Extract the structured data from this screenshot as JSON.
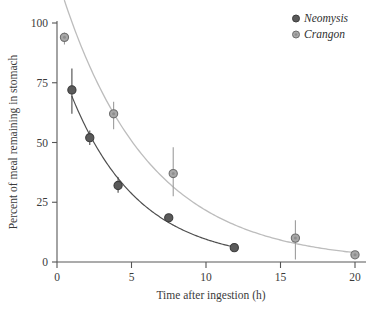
{
  "chart_data": {
    "type": "scatter",
    "title": "",
    "xlabel": "Time after ingestion (h)",
    "ylabel": "Percent of meal remaining in stomach",
    "xlim": [
      0,
      20.8
    ],
    "ylim": [
      0,
      100
    ],
    "xticks": [
      0,
      5,
      10,
      15,
      20
    ],
    "xtick_labels": [
      "0",
      "5",
      "10",
      "15",
      "20"
    ],
    "yticks": [
      0,
      25,
      50,
      75,
      100
    ],
    "ytick_labels": [
      "0",
      "25",
      "50",
      "75",
      "100"
    ],
    "grid": false,
    "legend_position": "top-right",
    "series": [
      {
        "name": "Neomysis",
        "marker": "filled-circle",
        "color": "#5a5a5a",
        "line_color": "#555555",
        "points": [
          {
            "x": 1.0,
            "y": 72.0,
            "err_low": 62.0,
            "err_high": 81.0
          },
          {
            "x": 2.2,
            "y": 52.0,
            "err_low": 49.0,
            "err_high": 55.0
          },
          {
            "x": 4.1,
            "y": 32.0,
            "err_low": 29.0,
            "err_high": 35.5
          },
          {
            "x": 7.5,
            "y": 18.5,
            "err_low": 18.5,
            "err_high": 18.5
          },
          {
            "x": 11.9,
            "y": 6.0,
            "err_low": 6.0,
            "err_high": 6.0
          }
        ],
        "fit_curve": "exponential decay"
      },
      {
        "name": "Crangon",
        "marker": "open-circle",
        "color": "#9d9d9d",
        "line_color": "#b4b4b4",
        "points": [
          {
            "x": 0.5,
            "y": 94.0,
            "err_low": 91.0,
            "err_high": 96.0
          },
          {
            "x": 3.8,
            "y": 62.0,
            "err_low": 55.5,
            "err_high": 67.0
          },
          {
            "x": 7.8,
            "y": 37.0,
            "err_low": 27.5,
            "err_high": 48.0
          },
          {
            "x": 16.0,
            "y": 10.0,
            "err_low": 1.0,
            "err_high": 17.5
          },
          {
            "x": 20.0,
            "y": 3.0,
            "err_low": 3.0,
            "err_high": 3.0
          }
        ],
        "fit_curve": "exponential decay"
      }
    ]
  },
  "legend": {
    "entries": [
      {
        "label": "Neomysis",
        "marker": "filled-circle"
      },
      {
        "label": "Crangon",
        "marker": "open-circle"
      }
    ]
  },
  "colors": {
    "neomysis_marker": "#5a5a5a",
    "neomysis_edge": "#3d3d3d",
    "crangon_marker": "#a8a8a8",
    "crangon_edge": "#6e6e6e",
    "neomysis_line": "#4f4f4f",
    "crangon_line": "#bdbdbd",
    "axis": "#555555",
    "text": "#3b3b3b",
    "background": "#ffffff"
  }
}
